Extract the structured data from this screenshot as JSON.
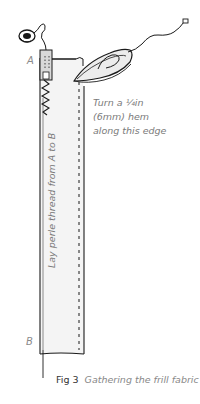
{
  "figure": {
    "number": "Fig 3",
    "title": "Gathering the frill fabric"
  },
  "labels": {
    "point_a": "A",
    "point_b": "B",
    "hem_instruction": [
      "Turn a ¼in",
      "(6mm) hem",
      "along this edge"
    ],
    "thread_instruction": "Lay perle thread from A to B"
  },
  "icons": {
    "thread_spool": "thread-spool-icon",
    "presser_foot": "presser-foot-icon",
    "iron": "iron-icon",
    "power_cord": "power-cord-icon"
  },
  "colors": {
    "line": "#1a1a1a",
    "fabric": "#f3f3f3",
    "text": "#7a7a7a"
  }
}
